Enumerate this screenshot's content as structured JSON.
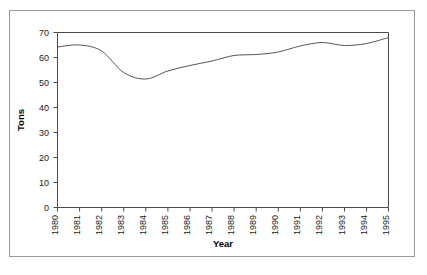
{
  "figure": {
    "background_color": "#ffffff",
    "border_color": "#9a9a9a",
    "axis_color": "#4a4a4a",
    "line_color": "#555555"
  },
  "chart_data": {
    "type": "line",
    "title": "",
    "subtitle": "",
    "xlabel": "Year",
    "ylabel": "Tons",
    "categories": [
      "1980",
      "1981",
      "1982",
      "1983",
      "1984",
      "1985",
      "1986",
      "1987",
      "1988",
      "1989",
      "1990",
      "1991",
      "1992",
      "1993",
      "1994",
      "1995"
    ],
    "x": [
      1980,
      1981,
      1982,
      1983,
      1984,
      1985,
      1986,
      1987,
      1988,
      1989,
      1990,
      1991,
      1992,
      1993,
      1994,
      1995
    ],
    "values": [
      64.2,
      65.0,
      62.6,
      54.0,
      51.4,
      54.6,
      56.8,
      58.6,
      60.8,
      61.2,
      62.2,
      64.6,
      66.0,
      64.8,
      65.6,
      68.0
    ],
    "series": [
      {
        "name": "Tons",
        "values": [
          64.2,
          65.0,
          62.6,
          54.0,
          51.4,
          54.6,
          56.8,
          58.6,
          60.8,
          61.2,
          62.2,
          64.6,
          66.0,
          64.8,
          65.6,
          68.0
        ]
      }
    ],
    "xlim": [
      1980,
      1995
    ],
    "ylim": [
      0,
      70
    ],
    "yticks": [
      0,
      10,
      20,
      30,
      40,
      50,
      60,
      70
    ],
    "ytick_labels": [
      "0",
      "10",
      "20",
      "30",
      "40",
      "50",
      "60",
      "70"
    ],
    "xtick_labels": [
      "1980",
      "1981",
      "1982",
      "1983",
      "1984",
      "1985",
      "1986",
      "1987",
      "1988",
      "1989",
      "1990",
      "1991",
      "1992",
      "1993",
      "1994",
      "1995"
    ],
    "xtick_rotation": -90,
    "grid": false,
    "legend": false,
    "legend_position": "none",
    "markers": false,
    "annotations": []
  }
}
